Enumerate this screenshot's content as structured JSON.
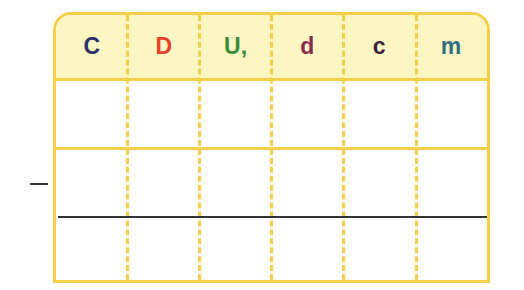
{
  "table": {
    "headers": [
      {
        "label": "C",
        "color": "#2b2f6b"
      },
      {
        "label": "D",
        "color": "#e8412a"
      },
      {
        "label": "U,",
        "color": "#3a8a3a"
      },
      {
        "label": "d",
        "color": "#8a2b4b"
      },
      {
        "label": "c",
        "color": "#3b1f3f"
      },
      {
        "label": "m",
        "color": "#2f6f7f"
      }
    ],
    "rows": [
      [
        "",
        "",
        "",
        "",
        "",
        ""
      ],
      [
        "",
        "",
        "",
        "",
        "",
        ""
      ],
      [
        "",
        "",
        "",
        "",
        "",
        ""
      ]
    ],
    "border_color": "#f6cf4a",
    "header_bg": "#fdf5c2"
  },
  "operation": {
    "sign": "minus"
  }
}
